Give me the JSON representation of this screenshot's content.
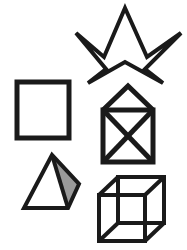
{
  "figure": {
    "background_color": "#ffffff",
    "stroke_color": "#1a1a1a",
    "shade_color": "#9a9a9a",
    "width": 187,
    "height": 250,
    "shape_count": 5
  },
  "shapes": {
    "star": {
      "name": "five-pointed-star",
      "label": "Five-pointed star (pentagram outline)",
      "stroke_width": 4,
      "points": "125,8 144,56 181,33 146,70 165,82 109,62 90,82 112,56 76,33 114,56",
      "outline": "125,8 147,57 181,33 145,69 163,83 125,62 88,83 106,69 76,33 104,57 125,8"
    },
    "square": {
      "name": "square",
      "label": "Plain square",
      "stroke_width": 5,
      "x": 17,
      "y": 82,
      "width": 52,
      "height": 56
    },
    "house": {
      "name": "house-with-cross",
      "label": "Square with inscribed X topped by triangular roof",
      "stroke_width": 5,
      "roof": "103,110 128,86 153,110",
      "body_x": 103,
      "body_y": 110,
      "body_width": 50,
      "body_height": 52,
      "diagonal_one": "103,110 153,162",
      "diagonal_two": "153,110 103,162"
    },
    "pyramid": {
      "name": "shaded-pyramid",
      "label": "Three-dimensional pyramid with shaded right face",
      "stroke_width": 4,
      "apex": "52,155",
      "front_left": "24,208",
      "front_right": "68,208",
      "back_right": "79,184",
      "left_face": "52,155 24,208 68,208",
      "right_face": "52,155 68,208 79,184",
      "outline": "52,155 24,208 68,208 79,184 52,155",
      "inner_edge": "52,155 68,208"
    },
    "cube": {
      "name": "wireframe-cube",
      "label": "Transparent wireframe cube (Necker cube)",
      "stroke_width": 4,
      "front_face": "99,195 99,241 145,241 145,195",
      "back_face": "118,177 118,223 164,223 164,177",
      "connector_top_left": "99,195 118,177",
      "connector_top_right": "145,195 164,177",
      "connector_bottom_right": "145,241 164,223",
      "connector_bottom_left": "99,241 118,223"
    }
  }
}
